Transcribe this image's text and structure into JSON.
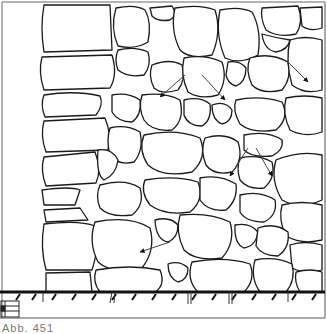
{
  "figure": {
    "caption": "Abb. 451",
    "line_color": "#1a1a1a",
    "background": "#ffffff",
    "frame_color": "#999999",
    "arrow_count": 7
  }
}
